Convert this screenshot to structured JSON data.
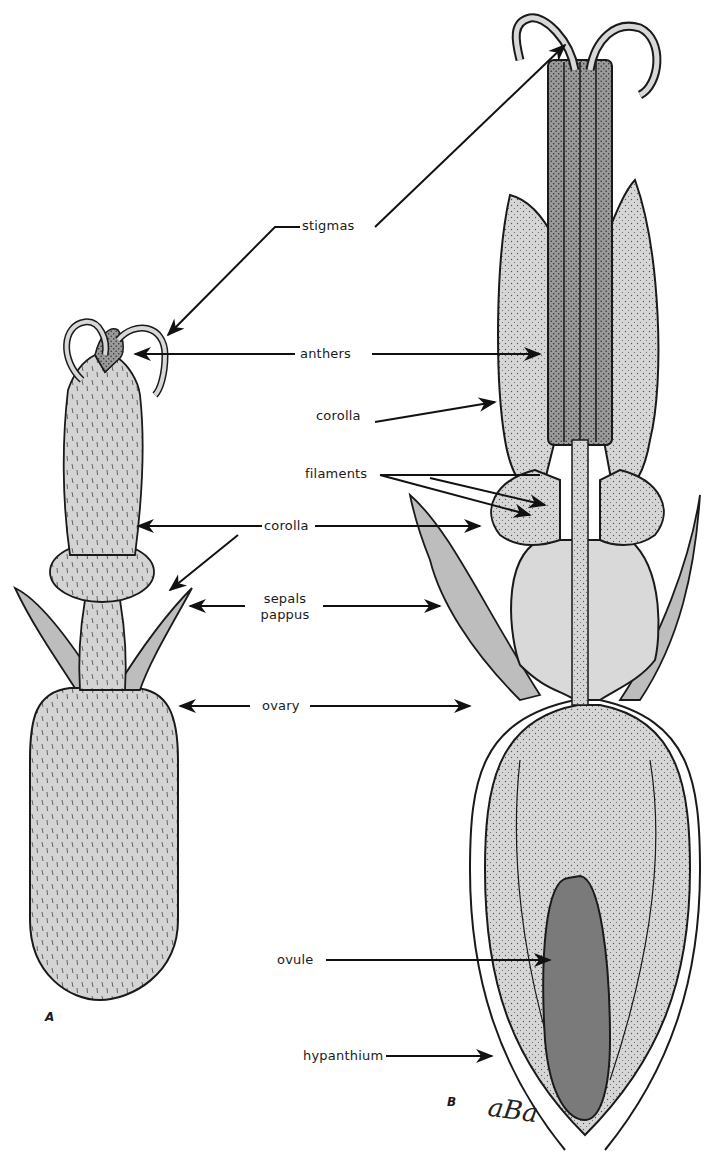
{
  "figure": {
    "panels": [
      {
        "id": "A",
        "label": "A",
        "description": "external view of flower"
      },
      {
        "id": "B",
        "label": "B",
        "description": "longitudinal section of flower"
      }
    ],
    "signature": "aBa",
    "colors": {
      "background": "#ffffff",
      "ink": "#1a1a1a",
      "light_tissue": "#d9d9d9",
      "mid_tissue": "#bdbdbd",
      "dark_tissue": "#8a8a8a",
      "anther_fill": "#9a9a9a",
      "ovule_fill": "#7a7a7a"
    }
  },
  "labels": [
    {
      "id": "stigmas",
      "text": "stigmas"
    },
    {
      "id": "anthers",
      "text": "anthers"
    },
    {
      "id": "corolla_b_upper",
      "text": "corolla"
    },
    {
      "id": "filaments",
      "text": "filaments"
    },
    {
      "id": "corolla_middle",
      "text": "corolla"
    },
    {
      "id": "sepals",
      "text": "sepals"
    },
    {
      "id": "pappus",
      "text": "pappus"
    },
    {
      "id": "ovary",
      "text": "ovary"
    },
    {
      "id": "ovule",
      "text": "ovule"
    },
    {
      "id": "hypanthium",
      "text": "hypanthium"
    }
  ]
}
